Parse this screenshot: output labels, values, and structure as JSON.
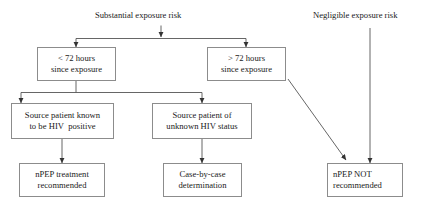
{
  "diagram": {
    "title_labels": [
      {
        "id": "substantial",
        "text": "Substantial exposure risk"
      },
      {
        "id": "negligible",
        "text": "Negligible exposure risk"
      }
    ],
    "nodes": [
      {
        "id": "lt72",
        "line1": "< 72 hours",
        "line2": "since exposure"
      },
      {
        "id": "gt72",
        "line1": "> 72 hours",
        "line2": "since exposure"
      },
      {
        "id": "known-positive",
        "line1": "Source patient known",
        "line2": "to be HIV  positive"
      },
      {
        "id": "unknown-status",
        "line1": "Source patient of",
        "line2": "unknown HIV status"
      },
      {
        "id": "npep-recommended",
        "line1": "nPEP treatment",
        "line2": "recommended"
      },
      {
        "id": "case-by-case",
        "line1": "Case-by-case",
        "line2": "determination"
      },
      {
        "id": "npep-not-recommended",
        "line1": "nPEP NOT",
        "line2": "recommended"
      }
    ],
    "colors": {
      "box_border": "#8c8c8c",
      "connector": "#555555",
      "text": "#1a1a1a",
      "background": "#ffffff"
    }
  }
}
